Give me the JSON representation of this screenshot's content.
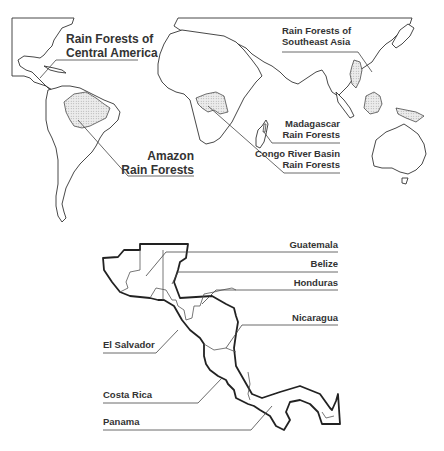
{
  "world_map": {
    "labels": {
      "central_america": [
        "Rain Forests of",
        "Central America"
      ],
      "southeast_asia": [
        "Rain Forests of",
        "Southeast Asia"
      ],
      "madagascar": [
        "Madagascar",
        "Rain Forests"
      ],
      "congo": [
        "Congo River Basin",
        "Rain Forests"
      ],
      "amazon": [
        "Amazon",
        "Rain Forests"
      ]
    },
    "forest_fill_color": "#d9d9d9"
  },
  "central_america_map": {
    "countries": {
      "guatemala": "Guatemala",
      "belize": "Belize",
      "honduras": "Honduras",
      "nicaragua": "Nicaragua",
      "el_salvador": "El Salvador",
      "costa_rica": "Costa Rica",
      "panama": "Panama"
    }
  }
}
